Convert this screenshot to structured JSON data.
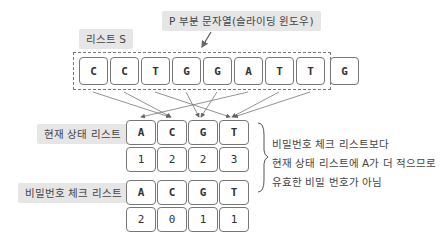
{
  "title_label": "P 부분 문자열(슬라이딩 윈도우)",
  "list_s_label": "리스트 S",
  "sequence": [
    "C",
    "C",
    "T",
    "G",
    "G",
    "A",
    "T",
    "T",
    "G"
  ],
  "current_state": {
    "label": "현재 상태 리스트",
    "keys": [
      "A",
      "C",
      "G",
      "T"
    ],
    "values": [
      "1",
      "2",
      "2",
      "3"
    ]
  },
  "password_check": {
    "label": "비밀번호 체크 리스트",
    "keys": [
      "A",
      "C",
      "G",
      "T"
    ],
    "values": [
      "2",
      "0",
      "1",
      "1"
    ]
  },
  "note": {
    "line1": "비밀번호 체크 리스트보다",
    "line2": "현재 상태 리스트에 A가 더 적으므로",
    "line3": "유효한 비밀 번호가 아님"
  },
  "colors": {
    "box_border": "#777777",
    "label_bg": "#e6e6e6",
    "arrow": "#666666"
  }
}
